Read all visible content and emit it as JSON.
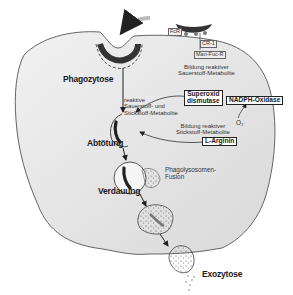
{
  "diagram": {
    "colors": {
      "cell_fill": "#e6e6e6",
      "cell_outline": "#555555",
      "bacterium": "#2b2b2b",
      "text": "#1a1a1a",
      "background": "#ffffff"
    },
    "receptors": {
      "fcr": "FcR",
      "cr1": "CR-1",
      "manfuc": "Man-Fuc-R"
    },
    "stages": {
      "phagocytosis": "Phagozytose",
      "killing": "Abtötung",
      "digestion": "Verdauung",
      "exocytosis": "Exozytose"
    },
    "annotations": {
      "ros_formation_line1": "Bildung reaktiver",
      "ros_formation_line2": "Sauerstoff-Metabolite",
      "reactive_line1": "reaktive",
      "reactive_line2": "Sauerstoff- und",
      "reactive_line3": "Stickstoff-Metabolite",
      "rns_formation_line1": "Bildung reaktiver",
      "rns_formation_line2": "Stickstoff-Metabolite",
      "fusion_line1": "Phagolysosomen-",
      "fusion_line2": "Fusion",
      "o2": "O₂"
    },
    "enzymes": {
      "sod_line1": "Superoxid",
      "sod_line2": "dismutase",
      "nadph": "NADPH-Oxidase",
      "arginine": "L-Arginin"
    }
  }
}
